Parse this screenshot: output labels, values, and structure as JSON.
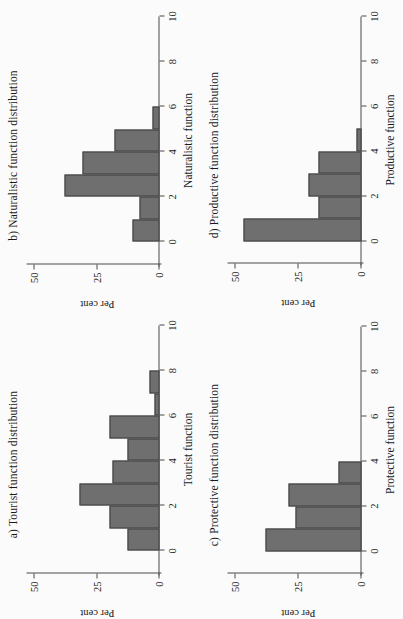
{
  "figure": {
    "background": "#fbfbfb",
    "bar_fill": "#6f6f6f",
    "bar_stroke": "#3f3f3f",
    "axis_color": "#4a4a4a",
    "orientation_note": "rotated"
  },
  "chart_data": [
    {
      "id": "a",
      "type": "bar",
      "title": "a) Tourist function distribution",
      "xlabel": "Tourist function",
      "ylabel": "Per cent",
      "xlim": [
        -1,
        10
      ],
      "ylim": [
        0,
        50
      ],
      "xticks": [
        0,
        2,
        4,
        6,
        8,
        10
      ],
      "xtick_labels": [
        "0",
        "2",
        "4",
        "6",
        "8",
        "10"
      ],
      "yticks": [
        0,
        25,
        50
      ],
      "ytick_labels": [
        "0",
        "25",
        "50"
      ],
      "grid": false,
      "legend": "none",
      "bin_width": 1,
      "bins": [
        {
          "x0": -1,
          "x1": 0,
          "value": 0
        },
        {
          "x0": 0,
          "x1": 1,
          "value": 13
        },
        {
          "x0": 1,
          "x1": 2,
          "value": 20
        },
        {
          "x0": 2,
          "x1": 3,
          "value": 32
        },
        {
          "x0": 3,
          "x1": 4,
          "value": 19
        },
        {
          "x0": 4,
          "x1": 5,
          "value": 13
        },
        {
          "x0": 5,
          "x1": 6,
          "value": 20
        },
        {
          "x0": 6,
          "x1": 7,
          "value": 2
        },
        {
          "x0": 7,
          "x1": 8,
          "value": 4
        }
      ]
    },
    {
      "id": "b",
      "type": "bar",
      "title": "b) Naturalistic function distribution",
      "xlabel": "Naturalistic function",
      "ylabel": "Per cent",
      "xlim": [
        -1,
        10
      ],
      "ylim": [
        0,
        50
      ],
      "xticks": [
        0,
        2,
        4,
        6,
        8,
        10
      ],
      "xtick_labels": [
        "0",
        "2",
        "4",
        "6",
        "8",
        "10"
      ],
      "yticks": [
        0,
        25,
        50
      ],
      "ytick_labels": [
        "0",
        "25",
        "50"
      ],
      "grid": false,
      "legend": "none",
      "bin_width": 1,
      "bins": [
        {
          "x0": -1,
          "x1": 0,
          "value": 0
        },
        {
          "x0": 0,
          "x1": 1,
          "value": 11
        },
        {
          "x0": 1,
          "x1": 2,
          "value": 8
        },
        {
          "x0": 2,
          "x1": 3,
          "value": 38
        },
        {
          "x0": 3,
          "x1": 4,
          "value": 31
        },
        {
          "x0": 4,
          "x1": 5,
          "value": 18
        },
        {
          "x0": 5,
          "x1": 6,
          "value": 3
        }
      ]
    },
    {
      "id": "c",
      "type": "bar",
      "title": "c) Protective function distribution",
      "xlabel": "Protective function",
      "ylabel": "Per cent",
      "xlim": [
        -1,
        10
      ],
      "ylim": [
        0,
        50
      ],
      "xticks": [
        0,
        2,
        4,
        6,
        8,
        10
      ],
      "xtick_labels": [
        "0",
        "2",
        "4",
        "6",
        "8",
        "10"
      ],
      "yticks": [
        0,
        25,
        50
      ],
      "ytick_labels": [
        "0",
        "25",
        "50"
      ],
      "grid": false,
      "legend": "none",
      "bin_width": 1,
      "bins": [
        {
          "x0": -1,
          "x1": 0,
          "value": 0
        },
        {
          "x0": 0,
          "x1": 1,
          "value": 38
        },
        {
          "x0": 1,
          "x1": 2,
          "value": 26
        },
        {
          "x0": 2,
          "x1": 3,
          "value": 29
        },
        {
          "x0": 3,
          "x1": 4,
          "value": 9
        }
      ]
    },
    {
      "id": "d",
      "type": "bar",
      "title": "d) Productive function distribution",
      "xlabel": "Productive function",
      "ylabel": "Per cent",
      "xlim": [
        -1,
        10
      ],
      "ylim": [
        0,
        50
      ],
      "xticks": [
        0,
        2,
        4,
        6,
        8,
        10
      ],
      "xtick_labels": [
        "0",
        "2",
        "4",
        "6",
        "8",
        "10"
      ],
      "yticks": [
        0,
        25,
        50
      ],
      "ytick_labels": [
        "0",
        "25",
        "50"
      ],
      "grid": false,
      "legend": "none",
      "bin_width": 1,
      "bins": [
        {
          "x0": -1,
          "x1": 0,
          "value": 0
        },
        {
          "x0": 0,
          "x1": 1,
          "value": 47
        },
        {
          "x0": 1,
          "x1": 2,
          "value": 17
        },
        {
          "x0": 2,
          "x1": 3,
          "value": 21
        },
        {
          "x0": 3,
          "x1": 4,
          "value": 17
        },
        {
          "x0": 4,
          "x1": 5,
          "value": 2
        }
      ]
    }
  ]
}
